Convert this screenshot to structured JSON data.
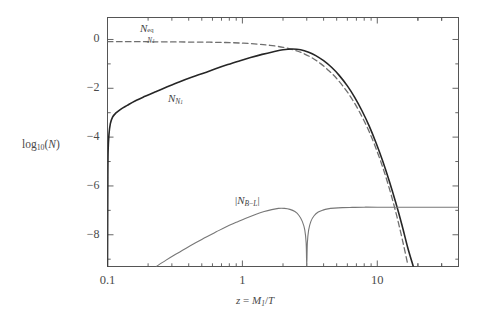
{
  "figure": {
    "background": "#ffffff",
    "frame_color": "#555555"
  },
  "axes": {
    "y_label": "log10(N)",
    "y_label_base": "10",
    "y_label_prefix": "log",
    "y_label_arg": "(N)",
    "x_label": "z = M1/T",
    "x_label_lhs": "z",
    "x_label_eq": " = ",
    "x_label_num": "M",
    "x_label_num_sub": "1",
    "x_label_den": "/T",
    "y_ticks": [
      "0",
      "-2",
      "-4",
      "-6",
      "-8"
    ],
    "y_tick_values": [
      0,
      -2,
      -4,
      -6,
      -8
    ],
    "x_ticks": [
      "0.1",
      "1",
      "10"
    ],
    "x_tick_values": [
      0.1,
      1,
      10
    ],
    "x_scale": "log",
    "y_scale": "linear",
    "xlim": [
      0.1,
      40
    ],
    "ylim": [
      -9.3,
      0.9
    ],
    "grid": false
  },
  "annotations": [
    {
      "name": "n-eq-label",
      "base": "N",
      "sup": "eq",
      "sub": "N1",
      "sub_main": "N",
      "sub_index": "1"
    },
    {
      "name": "n-n1-label",
      "base": "N",
      "sub_main": "N",
      "sub_index": "1"
    },
    {
      "name": "n-bl-label",
      "text": "|NB-L|",
      "bar_open": "|",
      "base": "N",
      "sub": "B-L",
      "bar_close": "|"
    }
  ],
  "chart_data": {
    "type": "line",
    "title": "",
    "xlabel": "z = M1/T",
    "ylabel": "log10(N)",
    "xlim": [
      0.1,
      40
    ],
    "ylim": [
      -9.3,
      0.9
    ],
    "xscale": "log",
    "grid": false,
    "legend": "inline-annotations",
    "series": [
      {
        "name": "N_N1^eq",
        "style": "dashed",
        "color": "#6f6f6f",
        "width": 1.3,
        "points": [
          [
            0.1,
            -0.09
          ],
          [
            0.13,
            -0.09
          ],
          [
            0.17,
            -0.09
          ],
          [
            0.22,
            -0.095
          ],
          [
            0.3,
            -0.1
          ],
          [
            0.4,
            -0.105
          ],
          [
            0.55,
            -0.11
          ],
          [
            0.75,
            -0.125
          ],
          [
            1.0,
            -0.15
          ],
          [
            1.3,
            -0.19
          ],
          [
            1.6,
            -0.24
          ],
          [
            2.0,
            -0.32
          ],
          [
            2.4,
            -0.43
          ],
          [
            2.8,
            -0.56
          ],
          [
            3.3,
            -0.76
          ],
          [
            3.8,
            -0.99
          ],
          [
            4.4,
            -1.29
          ],
          [
            5.0,
            -1.6
          ],
          [
            5.8,
            -2.04
          ],
          [
            6.6,
            -2.5
          ],
          [
            7.5,
            -3.04
          ],
          [
            8.5,
            -3.65
          ],
          [
            9.5,
            -4.28
          ],
          [
            11.0,
            -5.25
          ],
          [
            12.5,
            -6.25
          ],
          [
            14.0,
            -7.27
          ],
          [
            15.5,
            -8.31
          ],
          [
            16.8,
            -9.2
          ]
        ]
      },
      {
        "name": "N_N1",
        "style": "solid",
        "color": "#262626",
        "width": 1.6,
        "points": [
          [
            0.1,
            -9.3
          ],
          [
            0.1005,
            -6.0
          ],
          [
            0.101,
            -4.6
          ],
          [
            0.1025,
            -3.9
          ],
          [
            0.105,
            -3.45
          ],
          [
            0.109,
            -3.18
          ],
          [
            0.115,
            -3.02
          ],
          [
            0.125,
            -2.86
          ],
          [
            0.14,
            -2.7
          ],
          [
            0.16,
            -2.52
          ],
          [
            0.19,
            -2.33
          ],
          [
            0.23,
            -2.13
          ],
          [
            0.28,
            -1.93
          ],
          [
            0.34,
            -1.74
          ],
          [
            0.42,
            -1.55
          ],
          [
            0.52,
            -1.37
          ],
          [
            0.64,
            -1.19
          ],
          [
            0.78,
            -1.03
          ],
          [
            0.95,
            -0.88
          ],
          [
            1.15,
            -0.74
          ],
          [
            1.4,
            -0.61
          ],
          [
            1.7,
            -0.5
          ],
          [
            2.0,
            -0.42
          ],
          [
            2.35,
            -0.39
          ],
          [
            2.7,
            -0.42
          ],
          [
            3.1,
            -0.52
          ],
          [
            3.5,
            -0.66
          ],
          [
            4.0,
            -0.87
          ],
          [
            4.6,
            -1.15
          ],
          [
            5.2,
            -1.46
          ],
          [
            6.0,
            -1.9
          ],
          [
            6.8,
            -2.37
          ],
          [
            7.7,
            -2.92
          ],
          [
            8.7,
            -3.54
          ],
          [
            9.8,
            -4.24
          ],
          [
            11.0,
            -5.0
          ],
          [
            12.3,
            -5.82
          ],
          [
            13.7,
            -6.68
          ],
          [
            15.2,
            -7.58
          ],
          [
            16.8,
            -8.52
          ],
          [
            18.5,
            -9.3
          ]
        ]
      },
      {
        "name": "|N_B-L|",
        "style": "solid",
        "color": "#777777",
        "width": 1.1,
        "points": [
          [
            0.23,
            -9.3
          ],
          [
            0.27,
            -9.05
          ],
          [
            0.32,
            -8.8
          ],
          [
            0.38,
            -8.56
          ],
          [
            0.45,
            -8.33
          ],
          [
            0.54,
            -8.09
          ],
          [
            0.64,
            -7.88
          ],
          [
            0.76,
            -7.67
          ],
          [
            0.9,
            -7.49
          ],
          [
            1.05,
            -7.33
          ],
          [
            1.25,
            -7.17
          ],
          [
            1.45,
            -7.05
          ],
          [
            1.65,
            -6.97
          ],
          [
            1.85,
            -6.92
          ],
          [
            2.05,
            -6.92
          ],
          [
            2.25,
            -6.96
          ],
          [
            2.45,
            -7.05
          ],
          [
            2.62,
            -7.2
          ],
          [
            2.78,
            -7.45
          ],
          [
            2.9,
            -7.8
          ],
          [
            2.97,
            -8.35
          ],
          [
            3.0,
            -9.3
          ],
          [
            3.03,
            -8.35
          ],
          [
            3.1,
            -7.8
          ],
          [
            3.22,
            -7.45
          ],
          [
            3.4,
            -7.22
          ],
          [
            3.65,
            -7.07
          ],
          [
            3.95,
            -6.99
          ],
          [
            4.3,
            -6.94
          ],
          [
            4.8,
            -6.91
          ],
          [
            5.5,
            -6.89
          ],
          [
            6.5,
            -6.88
          ],
          [
            8.0,
            -6.87
          ],
          [
            10.0,
            -6.87
          ],
          [
            13.0,
            -6.87
          ],
          [
            18.0,
            -6.87
          ],
          [
            25.0,
            -6.87
          ],
          [
            40.0,
            -6.87
          ]
        ]
      }
    ]
  }
}
